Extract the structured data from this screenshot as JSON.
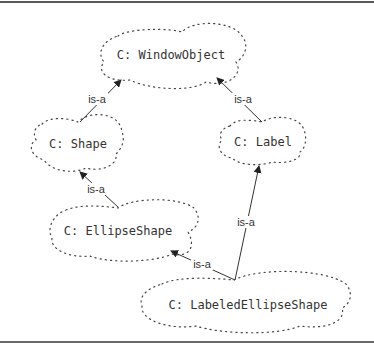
{
  "diagram": {
    "type": "class-hierarchy",
    "nodes": [
      {
        "id": "windowobject",
        "prefix": "C:",
        "name": "WindowObject",
        "label": "C: WindowObject"
      },
      {
        "id": "shape",
        "prefix": "C:",
        "name": "Shape",
        "label": "C: Shape"
      },
      {
        "id": "label",
        "prefix": "C:",
        "name": "Label",
        "label": "C: Label"
      },
      {
        "id": "ellipseshape",
        "prefix": "C:",
        "name": "EllipseShape",
        "label": "C: EllipseShape"
      },
      {
        "id": "labeledellipseshape",
        "prefix": "C:",
        "name": "LabeledEllipseShape",
        "label": "C: LabeledEllipseShape"
      }
    ],
    "edges": [
      {
        "from": "shape",
        "to": "windowobject",
        "label": "is-a"
      },
      {
        "from": "label",
        "to": "windowobject",
        "label": "is-a"
      },
      {
        "from": "ellipseshape",
        "to": "shape",
        "label": "is-a"
      },
      {
        "from": "labeledellipseshape",
        "to": "ellipseshape",
        "label": "is-a"
      },
      {
        "from": "labeledellipseshape",
        "to": "label",
        "label": "is-a"
      }
    ]
  }
}
